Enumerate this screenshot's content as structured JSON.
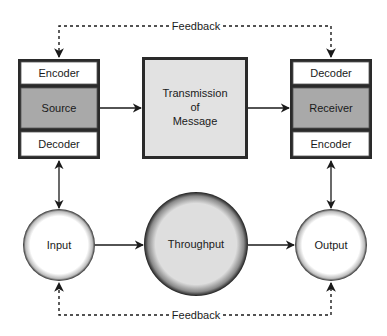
{
  "diagram": {
    "type": "communication-model",
    "feedback_top_label": "Feedback",
    "feedback_bottom_label": "Feedback",
    "sender_stack": {
      "top": "Encoder",
      "middle": "Source",
      "bottom": "Decoder"
    },
    "channel": {
      "line1": "Transmission",
      "line2": "of",
      "line3": "Message"
    },
    "receiver_stack": {
      "top": "Decoder",
      "middle": "Receiver",
      "bottom": "Encoder"
    },
    "input_node": "Input",
    "throughput_node": "Throughput",
    "output_node": "Output",
    "colors": {
      "stroke": "#1a1a1a",
      "band_white": "#ffffff",
      "band_gray": "#a9a9a9",
      "channel_fill": "#e2e2e2",
      "throughput_fill": "#dedede"
    }
  }
}
